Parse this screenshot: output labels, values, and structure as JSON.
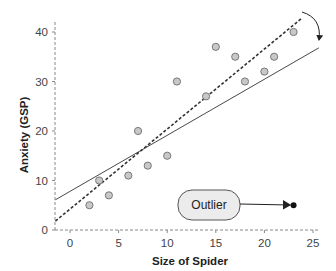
{
  "chart_data": {
    "type": "scatter",
    "title": "",
    "xlabel": "Size of Spider",
    "ylabel": "Anxiety (GSP)",
    "xlim": [
      -1.5,
      25
    ],
    "ylim": [
      0,
      42
    ],
    "xticks": [
      0,
      5,
      10,
      15,
      20,
      25
    ],
    "yticks": [
      0,
      10,
      20,
      30,
      40
    ],
    "grid": false,
    "legend": null,
    "series": [
      {
        "name": "data",
        "style": "gray circles",
        "points": [
          {
            "x": 2,
            "y": 5
          },
          {
            "x": 3,
            "y": 10
          },
          {
            "x": 4,
            "y": 7
          },
          {
            "x": 6,
            "y": 11
          },
          {
            "x": 7,
            "y": 20
          },
          {
            "x": 8,
            "y": 13
          },
          {
            "x": 10,
            "y": 15
          },
          {
            "x": 11,
            "y": 30
          },
          {
            "x": 14,
            "y": 27
          },
          {
            "x": 15,
            "y": 37
          },
          {
            "x": 17,
            "y": 35
          },
          {
            "x": 18,
            "y": 30
          },
          {
            "x": 20,
            "y": 32
          },
          {
            "x": 21,
            "y": 35
          },
          {
            "x": 23,
            "y": 40
          }
        ]
      },
      {
        "name": "outlier",
        "style": "black dot",
        "points": [
          {
            "x": 23,
            "y": 5
          }
        ]
      }
    ],
    "lines": [
      {
        "name": "fit-without-outlier",
        "style": "dashed",
        "from": {
          "x": -1.5,
          "y": 1.8
        },
        "to": {
          "x": 23.8,
          "y": 42.7
        }
      },
      {
        "name": "fit-with-outlier",
        "style": "solid",
        "from": {
          "x": -1.5,
          "y": 6.1
        },
        "to": {
          "x": 25.6,
          "y": 36.8
        }
      }
    ],
    "annotations": [
      {
        "text": "Outlier",
        "points_to": {
          "x": 23,
          "y": 5
        }
      },
      {
        "type": "curved-arrow",
        "from": "dashed line end",
        "to": "solid line end"
      }
    ]
  },
  "labels": {
    "xlabel": "Size of Spider",
    "ylabel": "Anxiety (GSP)",
    "outlier": "Outlier",
    "xticks": [
      "0",
      "5",
      "10",
      "15",
      "20",
      "25"
    ],
    "yticks": [
      "0",
      "10",
      "20",
      "30",
      "40"
    ]
  }
}
